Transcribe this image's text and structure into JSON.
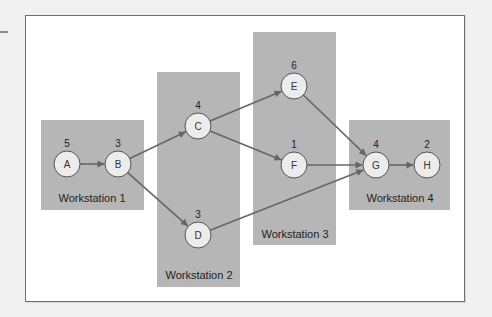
{
  "diagram": {
    "type": "precedence-diagram",
    "colors": {
      "background": "#f1f1f1",
      "frame_fill": "#ffffff",
      "frame_border": "#6e6e6e",
      "workstation_fill": "#b6b6b6",
      "node_fill": "#ececec",
      "node_stroke": "#555555",
      "arrow": "#666666"
    },
    "workstations": [
      {
        "id": "ws1",
        "label": "Workstation 1",
        "x": 41,
        "y": 120,
        "w": 103,
        "h": 90,
        "label_x": 92,
        "label_y": 202
      },
      {
        "id": "ws2",
        "label": "Workstation 2",
        "x": 157,
        "y": 72,
        "w": 83,
        "h": 215,
        "label_x": 199,
        "label_y": 279
      },
      {
        "id": "ws3",
        "label": "Workstation 3",
        "x": 253,
        "y": 32,
        "w": 83,
        "h": 213,
        "label_x": 295,
        "label_y": 238
      },
      {
        "id": "ws4",
        "label": "Workstation 4",
        "x": 349,
        "y": 120,
        "w": 101,
        "h": 90,
        "label_x": 400,
        "label_y": 202
      }
    ],
    "nodes": [
      {
        "id": "A",
        "label": "A",
        "time": "5",
        "cx": 67,
        "cy": 164
      },
      {
        "id": "B",
        "label": "B",
        "time": "3",
        "cx": 118,
        "cy": 164
      },
      {
        "id": "C",
        "label": "C",
        "time": "4",
        "cx": 198,
        "cy": 126
      },
      {
        "id": "D",
        "label": "D",
        "time": "3",
        "cx": 198,
        "cy": 235
      },
      {
        "id": "E",
        "label": "E",
        "time": "6",
        "cx": 294,
        "cy": 86
      },
      {
        "id": "F",
        "label": "F",
        "time": "1",
        "cx": 294,
        "cy": 165
      },
      {
        "id": "G",
        "label": "G",
        "time": "4",
        "cx": 376,
        "cy": 165
      },
      {
        "id": "H",
        "label": "H",
        "time": "2",
        "cx": 427,
        "cy": 165
      }
    ],
    "edges": [
      {
        "from": "A",
        "to": "B"
      },
      {
        "from": "B",
        "to": "C"
      },
      {
        "from": "B",
        "to": "D"
      },
      {
        "from": "C",
        "to": "E"
      },
      {
        "from": "C",
        "to": "F"
      },
      {
        "from": "E",
        "to": "G"
      },
      {
        "from": "F",
        "to": "G"
      },
      {
        "from": "D",
        "to": "G"
      },
      {
        "from": "G",
        "to": "H"
      }
    ],
    "node_radius": 13
  }
}
